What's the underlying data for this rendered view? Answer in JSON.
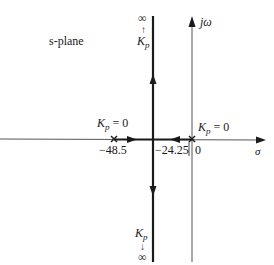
{
  "diagram": {
    "title": "s-plane",
    "axes": {
      "real_label": "σ",
      "imag_label": "jω"
    },
    "points": {
      "pole1_value": "−48.5",
      "breakaway_value": "−24.25",
      "pole2_value": "0"
    },
    "annotations": {
      "pole1_gain": "K",
      "pole1_gain_sub": "p",
      "pole1_gain_eq": " = 0",
      "pole2_gain": "K",
      "pole2_gain_sub": "p",
      "pole2_gain_eq": " = 0",
      "top_infinity": "∞",
      "top_arrow": "↑",
      "top_gain": "K",
      "top_gain_sub": "p",
      "bottom_infinity": "∞",
      "bottom_arrow": "↓",
      "bottom_gain": "K",
      "bottom_gain_sub": "p"
    },
    "colors": {
      "axis": "#555555",
      "locus": "#1a1a1a"
    }
  }
}
